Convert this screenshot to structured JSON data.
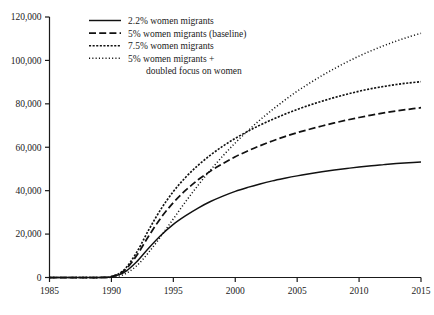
{
  "chart_data": {
    "type": "line",
    "title": "",
    "subtitle": "",
    "xlabel": "",
    "ylabel": "",
    "xlim": [
      1985,
      2015
    ],
    "ylim": [
      0,
      120000
    ],
    "grid": false,
    "legend_position": "top-left-inside",
    "x_ticks": [
      "1985",
      "1990",
      "1995",
      "2000",
      "2005",
      "2010",
      "2015"
    ],
    "x_tick_values": [
      1985,
      1990,
      1995,
      2000,
      2005,
      2010,
      2015
    ],
    "y_ticks": [
      "0",
      "20,000",
      "40,000",
      "60,000",
      "80,000",
      "100,000",
      "120,000"
    ],
    "y_tick_values": [
      0,
      20000,
      40000,
      60000,
      80000,
      100000,
      120000
    ],
    "x": [
      1985,
      1986,
      1987,
      1988,
      1989,
      1990,
      1991,
      1992,
      1993,
      1994,
      1995,
      1996,
      1997,
      1998,
      1999,
      2000,
      2001,
      2002,
      2003,
      2004,
      2005,
      2006,
      2007,
      2008,
      2009,
      2010,
      2011,
      2012,
      2013,
      2014,
      2015
    ],
    "series": [
      {
        "name": "2.2% women migrants",
        "dash": "solid",
        "color": "#111111",
        "values": [
          0,
          0,
          0,
          0,
          0,
          300,
          2200,
          7000,
          13500,
          19500,
          24500,
          28500,
          32000,
          35000,
          37500,
          39700,
          41500,
          43100,
          44500,
          45700,
          46800,
          47800,
          48700,
          49500,
          50200,
          50900,
          51500,
          52000,
          52500,
          52900,
          53200
        ]
      },
      {
        "name": "5% women migrants (baseline)",
        "dash": "dashed",
        "color": "#111111",
        "values": [
          0,
          0,
          0,
          0,
          0,
          400,
          3000,
          9800,
          19000,
          27500,
          34500,
          40200,
          45000,
          49000,
          52500,
          55600,
          58300,
          60700,
          62900,
          64900,
          66700,
          68300,
          69800,
          71200,
          72500,
          73700,
          74800,
          75800,
          76700,
          77500,
          78200
        ]
      },
      {
        "name": "7.5% women migrants",
        "dash": "dotted-dense",
        "color": "#111111",
        "values": [
          0,
          0,
          0,
          0,
          0,
          450,
          3400,
          11200,
          21800,
          31500,
          39600,
          46200,
          51700,
          56400,
          60500,
          64100,
          67300,
          70200,
          72800,
          75200,
          77400,
          79400,
          81200,
          82900,
          84400,
          85800,
          87000,
          88000,
          88900,
          89600,
          90200
        ]
      },
      {
        "name": "5% women migrants + doubled focus on women",
        "dash": "dotted-sparse",
        "color": "#111111",
        "values": [
          0,
          0,
          0,
          0,
          0,
          150,
          1400,
          5200,
          11500,
          19000,
          27000,
          35000,
          42500,
          49500,
          56000,
          62000,
          67500,
          72600,
          77300,
          81700,
          85800,
          89500,
          93000,
          96200,
          99200,
          102000,
          104500,
          106800,
          108900,
          110800,
          112500
        ]
      }
    ]
  },
  "legend": {
    "items": [
      {
        "label": "2.2% women migrants",
        "style": "solid"
      },
      {
        "label": "5% women migrants (baseline)",
        "style": "dashed"
      },
      {
        "label": "7.5% women migrants",
        "style": "dotted-dense"
      },
      {
        "label": "5% women migrants +",
        "style": "dotted-sparse"
      },
      {
        "label": "doubled focus on women",
        "style": "none"
      }
    ]
  }
}
